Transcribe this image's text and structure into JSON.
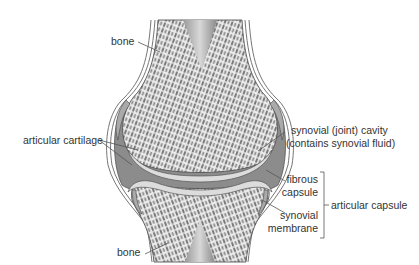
{
  "diagram": {
    "labels": {
      "bone_top": "bone",
      "bone_bottom": "bone",
      "articular_cartilage": "articular cartilage",
      "synovial_cavity_line1": "synovial (joint) cavity",
      "synovial_cavity_line2": "(contains synovial fluid)",
      "fibrous_capsule_line1": "fibrous",
      "fibrous_capsule_line2": "capsule",
      "synovial_membrane_line1": "synovial",
      "synovial_membrane_line2": "membrane",
      "articular_capsule": "articular capsule"
    },
    "colors": {
      "bone_fill": "#e6e6e6",
      "trabecular_marks": "#7a7a7a",
      "cavity_fill": "#8c8c8c",
      "cartilage_fill": "#dcdcdc",
      "marrow_gradient_dark": "#8a8a8a",
      "marrow_gradient_light": "#d8d8d8",
      "outline": "#555555",
      "leader_line": "#555555"
    }
  }
}
